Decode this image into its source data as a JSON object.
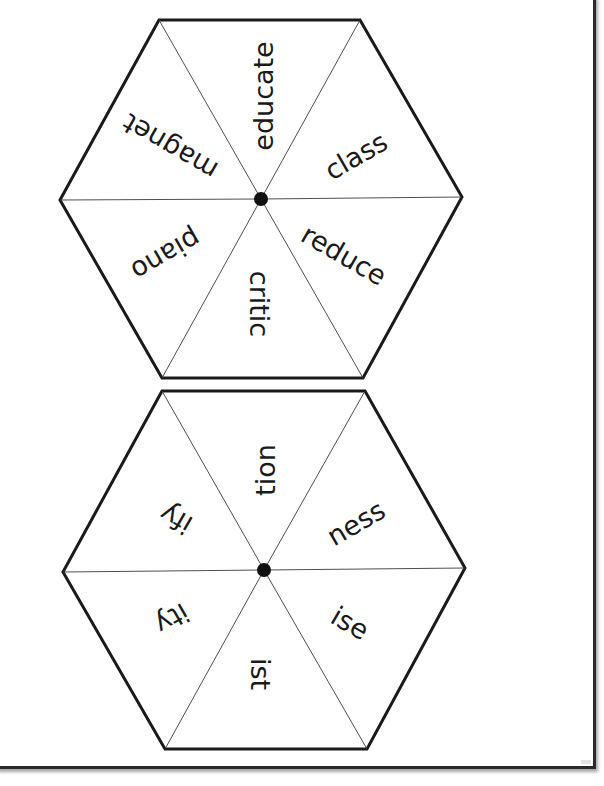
{
  "worksheet": {
    "title": "Word spinner hexagons",
    "colors": {
      "outline": "#1a1a1a",
      "spokes": "#3a3a3a",
      "pivot": "#111111",
      "text": "#1a1a1a",
      "page_border": "#2a2a2a"
    },
    "spinners": [
      {
        "name": "base-words",
        "center": [
          261,
          199
        ],
        "vertices": [
          [
            159,
            20
          ],
          [
            360,
            20
          ],
          [
            462,
            197
          ],
          [
            363,
            378
          ],
          [
            162,
            378
          ],
          [
            60,
            200
          ]
        ],
        "segments": [
          {
            "position": "top",
            "word": "educate",
            "x": 263,
            "y": 96,
            "rotate": -90
          },
          {
            "position": "upper-right",
            "word": "class",
            "x": 356,
            "y": 156,
            "rotate": -30
          },
          {
            "position": "lower-right",
            "word": "reduce",
            "x": 344,
            "y": 255,
            "rotate": 30
          },
          {
            "position": "bottom",
            "word": "critic",
            "x": 259,
            "y": 304,
            "rotate": 90
          },
          {
            "position": "lower-left",
            "word": "piano",
            "x": 166,
            "y": 255,
            "rotate": 150
          },
          {
            "position": "upper-left",
            "word": "magnet",
            "x": 170,
            "y": 147,
            "rotate": -150
          }
        ]
      },
      {
        "name": "suffixes",
        "center": [
          264,
          570
        ],
        "vertices": [
          [
            162,
            391
          ],
          [
            365,
            391
          ],
          [
            465,
            568
          ],
          [
            367,
            749
          ],
          [
            165,
            749
          ],
          [
            63,
            572
          ]
        ],
        "segments": [
          {
            "position": "top",
            "word": "tion",
            "x": 265,
            "y": 470,
            "rotate": -90
          },
          {
            "position": "upper-right",
            "word": "ness",
            "x": 356,
            "y": 523,
            "rotate": -30
          },
          {
            "position": "lower-right",
            "word": "ise",
            "x": 350,
            "y": 623,
            "rotate": 30
          },
          {
            "position": "bottom",
            "word": "ist",
            "x": 260,
            "y": 674,
            "rotate": 90
          },
          {
            "position": "lower-left",
            "word": "ity",
            "x": 172,
            "y": 619,
            "rotate": 150
          },
          {
            "position": "upper-left",
            "word": "ify",
            "x": 176,
            "y": 519,
            "rotate": -150
          }
        ]
      }
    ]
  }
}
